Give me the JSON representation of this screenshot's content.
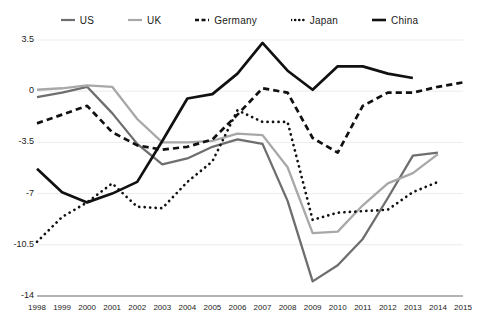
{
  "legend": {
    "position": "top-center",
    "items": [
      {
        "name": "US",
        "style": "solid",
        "color": "#6e6e6e",
        "width": 2.2
      },
      {
        "name": "UK",
        "style": "solid",
        "color": "#a8a8a8",
        "width": 2.2
      },
      {
        "name": "Germany",
        "style": "dashed",
        "color": "#111111",
        "width": 2.6
      },
      {
        "name": "Japan",
        "style": "dotted",
        "color": "#111111",
        "width": 2.6
      },
      {
        "name": "China",
        "style": "solid",
        "color": "#111111",
        "width": 2.6
      }
    ]
  },
  "axes": {
    "y_ticks": [
      "3.5",
      "0",
      "-3.5",
      "-7",
      "-10.5",
      "-14"
    ],
    "x_ticks": [
      "1998",
      "1999",
      "2000",
      "2001",
      "2002",
      "2003",
      "2004",
      "2005",
      "2006",
      "2007",
      "2008",
      "2009",
      "2010",
      "2011",
      "2012",
      "2013",
      "2014",
      "2015"
    ]
  },
  "chart_data": {
    "type": "line",
    "title": "",
    "xlabel": "",
    "ylabel": "",
    "xlim": [
      1998,
      2015
    ],
    "ylim": [
      -14,
      3.5
    ],
    "grid": true,
    "gridlines_y": [
      3.5,
      0,
      -3.5,
      -7,
      -10.5,
      -14
    ],
    "legend_position": "top-center",
    "x": [
      1998,
      1999,
      2000,
      2001,
      2002,
      2003,
      2004,
      2005,
      2006,
      2007,
      2008,
      2009,
      2010,
      2011,
      2012,
      2013,
      2014,
      2015
    ],
    "series": [
      {
        "name": "US",
        "color": "#6e6e6e",
        "style": "solid",
        "x": [
          1998,
          1999,
          2000,
          2001,
          2002,
          2003,
          2004,
          2005,
          2006,
          2007,
          2008,
          2009,
          2010,
          2011,
          2012,
          2013,
          2014
        ],
        "values": [
          -0.4,
          -0.1,
          0.3,
          -1.5,
          -3.6,
          -5.0,
          -4.6,
          -3.8,
          -3.3,
          -3.6,
          -7.5,
          -13.0,
          -11.9,
          -10.1,
          -7.3,
          -4.4,
          -4.2
        ]
      },
      {
        "name": "UK",
        "color": "#a8a8a8",
        "style": "solid",
        "x": [
          1998,
          1999,
          2000,
          2001,
          2002,
          2003,
          2004,
          2005,
          2006,
          2007,
          2008,
          2009,
          2010,
          2011,
          2012,
          2013,
          2014
        ],
        "values": [
          0.1,
          0.2,
          0.4,
          0.3,
          -1.9,
          -3.5,
          -3.5,
          -3.4,
          -2.9,
          -3.0,
          -5.2,
          -9.7,
          -9.6,
          -7.8,
          -6.3,
          -5.6,
          -4.3
        ]
      },
      {
        "name": "Germany",
        "color": "#111111",
        "style": "dashed",
        "x": [
          1998,
          1999,
          2000,
          2001,
          2002,
          2003,
          2004,
          2005,
          2006,
          2007,
          2008,
          2009,
          2010,
          2011,
          2012,
          2013,
          2014,
          2015
        ],
        "values": [
          -2.2,
          -1.6,
          -1.0,
          -2.8,
          -3.7,
          -4.0,
          -3.8,
          -3.3,
          -1.6,
          0.2,
          -0.1,
          -3.2,
          -4.2,
          -1.0,
          -0.1,
          -0.1,
          0.3,
          0.6
        ]
      },
      {
        "name": "Japan",
        "color": "#111111",
        "style": "dotted",
        "x": [
          1998,
          1999,
          2000,
          2001,
          2002,
          2003,
          2004,
          2005,
          2006,
          2007,
          2008,
          2009,
          2010,
          2011,
          2012,
          2013,
          2014
        ],
        "values": [
          -10.3,
          -8.6,
          -7.6,
          -6.3,
          -7.9,
          -8.0,
          -6.2,
          -4.8,
          -1.3,
          -2.1,
          -2.1,
          -8.8,
          -8.3,
          -8.2,
          -8.1,
          -6.9,
          -6.2
        ]
      },
      {
        "name": "China",
        "color": "#111111",
        "style": "solid",
        "x": [
          1998,
          1999,
          2000,
          2001,
          2002,
          2003,
          2004,
          2005,
          2006,
          2007,
          2008,
          2009,
          2010,
          2011,
          2012,
          2013
        ],
        "values": [
          -5.3,
          -6.9,
          -7.6,
          -7.0,
          -6.2,
          -3.4,
          -0.5,
          -0.2,
          1.2,
          3.3,
          1.4,
          0.1,
          1.7,
          1.7,
          1.2,
          0.9
        ]
      }
    ]
  }
}
